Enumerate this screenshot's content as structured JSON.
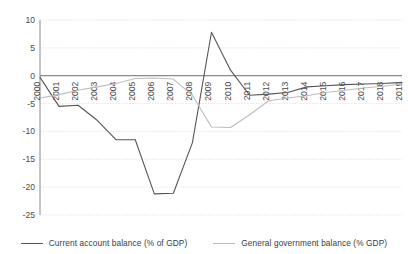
{
  "chart_data": {
    "type": "line",
    "title": "",
    "subtitle": "",
    "xlabel": "",
    "ylabel": "",
    "grid": true,
    "legend_position": "bottom",
    "x": [
      2000,
      2001,
      2002,
      2003,
      2004,
      2005,
      2006,
      2007,
      2008,
      2009,
      2010,
      2011,
      2012,
      2013,
      2014,
      2015,
      2016,
      2017,
      2018,
      2019
    ],
    "xtick_labels": [
      "2000",
      "2001",
      "2002",
      "2003",
      "2004",
      "2005",
      "2006",
      "2007",
      "2008",
      "2009",
      "2010",
      "2011",
      "2012",
      "2013",
      "2014",
      "2015",
      "2016",
      "2017",
      "2018",
      "2019"
    ],
    "ytick_labels": [
      "10",
      "5",
      "0",
      "-5",
      "-10",
      "-15",
      "-20",
      "-25"
    ],
    "yticks": [
      10,
      5,
      0,
      -5,
      -10,
      -15,
      -20,
      -25
    ],
    "ylim": [
      -25,
      10
    ],
    "xlim": [
      2000,
      2019
    ],
    "series": [
      {
        "name": "Current account balance (% of GDP)",
        "color": "#565656",
        "values": [
          -0.3,
          -5.5,
          -5.3,
          -8.0,
          -11.5,
          -11.5,
          -21.2,
          -21.1,
          -12.0,
          7.8,
          1.0,
          -3.5,
          -3.3,
          -3.0,
          -2.0,
          -1.8,
          -1.6,
          -1.5,
          -1.4,
          -1.2
        ]
      },
      {
        "name": "General government balance (% GDP)",
        "color": "#bdbdbd",
        "values": [
          -4.0,
          -3.4,
          -2.6,
          -2.0,
          -1.4,
          -0.5,
          -0.4,
          -0.6,
          -3.5,
          -9.2,
          -9.3,
          -7.0,
          -4.5,
          -4.0,
          -3.6,
          -3.0,
          -2.6,
          -2.2,
          -1.9,
          -1.5
        ]
      }
    ],
    "legend": [
      {
        "label": "Current account balance (% of GDP)",
        "color": "#565656"
      },
      {
        "label": "General government balance (% GDP)",
        "color": "#bdbdbd"
      }
    ],
    "axis_color": "#8a8a8a",
    "grid_color": "#d8d8d8",
    "zero_line_color": "#6e6e6e"
  }
}
